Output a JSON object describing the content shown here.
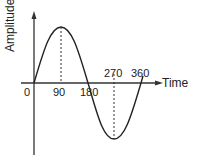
{
  "diagram": {
    "y_axis_label": "Amplitude",
    "x_axis_label": "Time",
    "ticks": [
      {
        "label": "0"
      },
      {
        "label": "90"
      },
      {
        "label": "180"
      },
      {
        "label": "270"
      },
      {
        "label": "360"
      }
    ],
    "curve": "sine wave, one full cycle from 0 to 360",
    "stroke_color": "#222222"
  }
}
